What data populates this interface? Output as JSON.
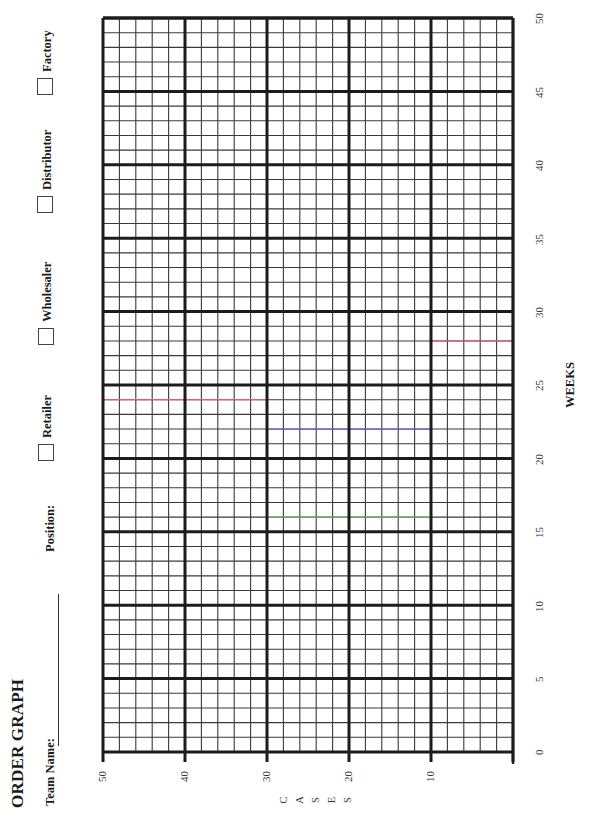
{
  "header": {
    "title": "ORDER GRAPH",
    "team_name_label": "Team Name:",
    "position_label": "Position:"
  },
  "positions": [
    {
      "label": "Retailer",
      "checked": false
    },
    {
      "label": "Wholesaler",
      "checked": false
    },
    {
      "label": "Distributor",
      "checked": false
    },
    {
      "label": "Factory",
      "checked": false
    }
  ],
  "axes": {
    "x_label": "WEEKS",
    "y_label_letters": [
      "C",
      "A",
      "S",
      "E",
      "S"
    ],
    "week_ticks": [
      "0",
      "5",
      "10",
      "15",
      "20",
      "25",
      "30",
      "35",
      "40",
      "45",
      "50"
    ],
    "case_ticks": [
      "50",
      "40",
      "30",
      "20",
      "10"
    ]
  },
  "colors": {
    "grid_major": "#1c1c1c",
    "grid_minor": "#3a3a3a",
    "trace_red": "#d9607a",
    "trace_blue": "#6a6ad0",
    "trace_green": "#6fbf6f"
  },
  "chart_data": {
    "type": "line",
    "title": "ORDER GRAPH",
    "xlabel": "WEEKS",
    "ylabel": "CASES",
    "xlim": [
      0,
      50
    ],
    "ylim": [
      0,
      50
    ],
    "x_major_ticks": [
      0,
      5,
      10,
      15,
      20,
      25,
      30,
      35,
      40,
      45,
      50
    ],
    "y_major_ticks": [
      0,
      10,
      20,
      30,
      40,
      50
    ],
    "x_minor_step": 1,
    "y_minor_step": 2,
    "grid": true,
    "orientation": "rotated -90deg (weeks run bottom-to-top, cases run right-to-left)",
    "legend": [
      "Retailer",
      "Wholesaler",
      "Distributor",
      "Factory"
    ],
    "series": [],
    "faint_marks": [
      {
        "color": "red",
        "week": 24,
        "cases_range": [
          30,
          50
        ]
      },
      {
        "color": "red",
        "week": 28,
        "cases_range": [
          0,
          10
        ]
      },
      {
        "color": "blue",
        "week": 22,
        "cases_range": [
          10,
          30
        ]
      },
      {
        "color": "green",
        "week": 16,
        "cases_range": [
          10,
          30
        ]
      }
    ]
  }
}
